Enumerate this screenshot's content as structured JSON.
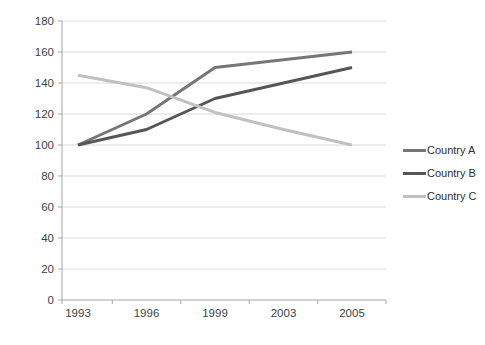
{
  "chart_data": {
    "type": "line",
    "categories": [
      "1993",
      "1996",
      "1999",
      "2003",
      "2005"
    ],
    "series": [
      {
        "name": "Country A",
        "values": [
          100,
          120,
          150,
          155,
          160
        ],
        "color": "#767676"
      },
      {
        "name": "Country B",
        "values": [
          100,
          110,
          130,
          140,
          150
        ],
        "color": "#565656"
      },
      {
        "name": "Country C",
        "values": [
          145,
          137,
          121,
          110,
          100
        ],
        "color": "#c0c0c0"
      }
    ],
    "xlabel": "",
    "ylabel": "",
    "ylim": [
      0,
      180
    ],
    "yticks": [
      0,
      20,
      40,
      60,
      80,
      100,
      120,
      140,
      160,
      180
    ],
    "grid": true,
    "legend_position": "right"
  },
  "colors": {
    "background": "#ffffff",
    "gridline": "#d9d9d9",
    "axis": "#a6a6a6",
    "tick_text": "#3f3f3f"
  }
}
